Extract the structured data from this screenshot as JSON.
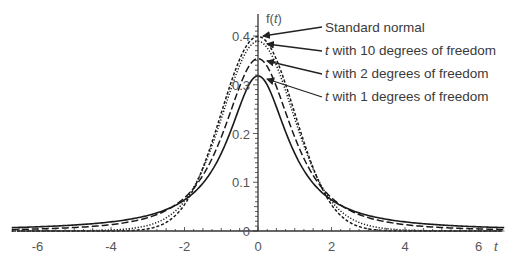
{
  "chart_data": {
    "type": "line",
    "title": "",
    "xlabel": "t",
    "ylabel": "f(t)",
    "xlim": [
      -6.7,
      6.7
    ],
    "ylim": [
      0,
      0.4
    ],
    "grid": false,
    "x_ticks": [
      -6,
      -4,
      -2,
      0,
      2,
      4,
      6
    ],
    "x_tick_labels": [
      "-6",
      "-4",
      "-2",
      "0",
      "2",
      "4",
      "6"
    ],
    "y_ticks": [
      0,
      0.1,
      0.2,
      0.3,
      0.4
    ],
    "y_tick_labels": [
      "0",
      "0.1",
      "0.2",
      "0.3",
      "0.4"
    ],
    "legend_position": "annotations with arrows, upper right of peak",
    "series": [
      {
        "name": "Standard normal",
        "label_prefix": "",
        "label_suffix": "Standard normal",
        "distribution": "normal",
        "df": null,
        "peak": 0.399,
        "style": "short-dash",
        "color": "#1a1a1a"
      },
      {
        "name": "t with 10 degrees of freedom",
        "label_prefix": "t",
        "label_suffix": " with 10 degrees of freedom",
        "distribution": "t",
        "df": 10,
        "peak": 0.389,
        "style": "dotted",
        "color": "#1a1a1a"
      },
      {
        "name": "t with 2 degrees of freedom",
        "label_prefix": "t",
        "label_suffix": " with 2 degrees of freedom",
        "distribution": "t",
        "df": 2,
        "peak": 0.354,
        "style": "long-dash",
        "color": "#1a1a1a"
      },
      {
        "name": "t with 1 degrees of freedom",
        "label_prefix": "t",
        "label_suffix": " with 1 degrees of freedom",
        "distribution": "t",
        "df": 1,
        "peak": 0.318,
        "style": "solid",
        "color": "#1a1a1a"
      }
    ]
  },
  "axes": {
    "x_label": "t",
    "y_label_f": "f(",
    "y_label_t": "t",
    "y_label_close": ")"
  }
}
